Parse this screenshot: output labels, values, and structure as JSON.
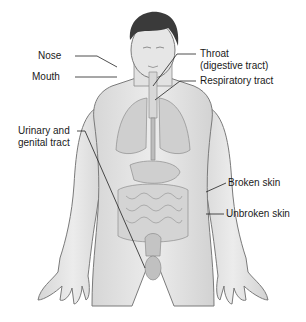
{
  "diagram": {
    "labels": {
      "nose": "Nose",
      "mouth": "Mouth",
      "throat_line1": "Throat",
      "throat_line2": "(digestive tract)",
      "respiratory": "Respiratory tract",
      "urinary_line1": "Urinary and",
      "urinary_line2": "genital tract",
      "broken_skin": "Broken skin",
      "unbroken_skin": "Unbroken skin"
    },
    "colors": {
      "skin": "#e4e4e4",
      "outline": "#7a7a7a",
      "hair": "#3a3a3a",
      "organs": "#cfcfcf",
      "leader": "#222222"
    }
  }
}
